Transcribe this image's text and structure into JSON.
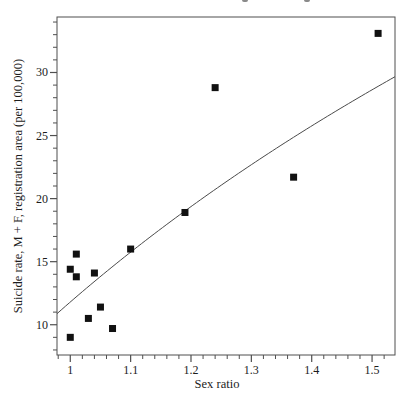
{
  "figure": {
    "top_text_remnants": [
      {
        "x": 242
      },
      {
        "x": 304
      }
    ]
  },
  "chart_data": {
    "type": "scatter",
    "title": "",
    "xlabel": "Sex ratio",
    "ylabel": "Suicide rate, M + F, registration area (per 100,000)",
    "xlim": [
      0.978,
      1.538
    ],
    "ylim": [
      7.6,
      34.4
    ],
    "x_major_ticks": [
      1.0,
      1.1,
      1.2,
      1.3,
      1.4,
      1.5
    ],
    "x_tick_labels": [
      "1",
      "1.1",
      "1.2",
      "1.3",
      "1.4",
      "1.5"
    ],
    "x_minor_step": 0.02,
    "y_major_ticks": [
      10,
      15,
      20,
      25,
      30
    ],
    "y_tick_labels": [
      "10",
      "15",
      "20",
      "25",
      "30"
    ],
    "y_minor_step": 1,
    "grid": false,
    "legend": "none",
    "points": [
      [
        1.0,
        9.0
      ],
      [
        1.0,
        14.4
      ],
      [
        1.01,
        15.6
      ],
      [
        1.01,
        13.8
      ],
      [
        1.03,
        10.5
      ],
      [
        1.04,
        14.1
      ],
      [
        1.05,
        11.4
      ],
      [
        1.07,
        9.7
      ],
      [
        1.1,
        16.0
      ],
      [
        1.19,
        18.9
      ],
      [
        1.24,
        28.8
      ],
      [
        1.37,
        21.7
      ],
      [
        1.51,
        33.1
      ]
    ],
    "fit_curve": {
      "type": "logarithmic",
      "formula": "y = 11.8 + 41.5*ln(x)",
      "a": 11.8,
      "b": 41.5,
      "x_start": 0.978,
      "x_end": 1.538
    },
    "marker": {
      "shape": "square",
      "size_px": 7,
      "color": "#111111"
    },
    "colors": {
      "background": "#ffffff",
      "axis": "#4f4f4f",
      "curve": "#4a4a4a",
      "text": "#1c1c1c"
    }
  }
}
